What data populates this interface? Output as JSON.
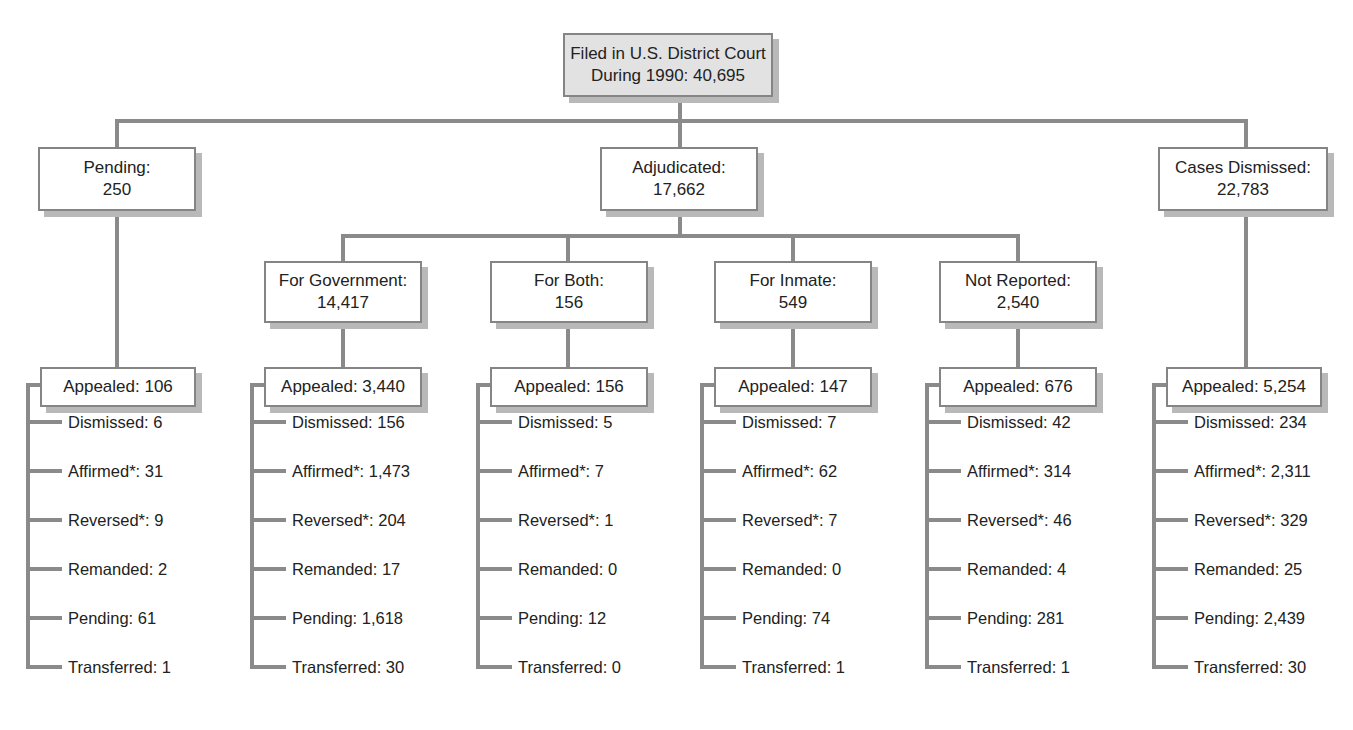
{
  "root": {
    "line1": "Filed in U.S. District Court",
    "line2": "During 1990:  40,695"
  },
  "level1": [
    {
      "label": "Pending:",
      "value": "250"
    },
    {
      "label": "Adjudicated:",
      "value": "17,662"
    },
    {
      "label": "Cases Dismissed:",
      "value": "22,783"
    }
  ],
  "level2": [
    {
      "label": "For Government:",
      "value": "14,417"
    },
    {
      "label": "For Both:",
      "value": "156"
    },
    {
      "label": "For Inmate:",
      "value": "549"
    },
    {
      "label": "Not Reported:",
      "value": "2,540"
    }
  ],
  "columns": [
    {
      "appealed": "Appealed: 106",
      "outcomes": [
        "Dismissed: 6",
        "Affirmed*: 31",
        "Reversed*: 9",
        "Remanded: 2",
        "Pending: 61",
        "Transferred: 1"
      ]
    },
    {
      "appealed": "Appealed: 3,440",
      "outcomes": [
        "Dismissed: 156",
        "Affirmed*: 1,473",
        "Reversed*: 204",
        "Remanded: 17",
        "Pending: 1,618",
        "Transferred: 30"
      ]
    },
    {
      "appealed": "Appealed: 156",
      "outcomes": [
        "Dismissed: 5",
        "Affirmed*: 7",
        "Reversed*: 1",
        "Remanded: 0",
        "Pending: 12",
        "Transferred: 0"
      ]
    },
    {
      "appealed": "Appealed: 147",
      "outcomes": [
        "Dismissed: 7",
        "Affirmed*: 62",
        "Reversed*: 7",
        "Remanded: 0",
        "Pending: 74",
        "Transferred: 1"
      ]
    },
    {
      "appealed": "Appealed: 676",
      "outcomes": [
        "Dismissed: 42",
        "Affirmed*: 314",
        "Reversed*: 46",
        "Remanded: 4",
        "Pending: 281",
        "Transferred: 1"
      ]
    },
    {
      "appealed": "Appealed: 5,254",
      "outcomes": [
        "Dismissed: 234",
        "Affirmed*: 2,311",
        "Reversed*: 329",
        "Remanded: 25",
        "Pending: 2,439",
        "Transferred: 30"
      ]
    }
  ],
  "colors": {
    "line": "#8a8a8a",
    "border": "#858585",
    "root_fill": "#e2e2e2",
    "shadow": "#b9b9b9"
  }
}
